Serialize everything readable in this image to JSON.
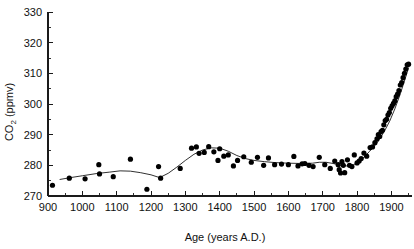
{
  "chart_data": {
    "type": "scatter",
    "title": "",
    "xlabel": "Age (years A.D.)",
    "ylabel": "CO2 (ppmv)",
    "ylabel_parts": {
      "species": "CO",
      "sub": "2",
      "unit": " (ppmv)"
    },
    "xlim": [
      900,
      1960
    ],
    "ylim": [
      270,
      330
    ],
    "x_major_ticks": [
      900,
      1000,
      1100,
      1200,
      1300,
      1400,
      1500,
      1600,
      1700,
      1800,
      1900
    ],
    "x_minor_step": 50,
    "y_major_ticks": [
      270,
      280,
      290,
      300,
      310,
      320,
      330
    ],
    "y_minor_step": 5,
    "grid": false,
    "legend": false,
    "marker": "filled-circle",
    "marker_color": "#000000",
    "line_color": "#1a1a1a",
    "series": [
      {
        "name": "CO2 measurements",
        "kind": "scatter",
        "points": [
          [
            913,
            273.5
          ],
          [
            962,
            275.8
          ],
          [
            1008,
            275.6
          ],
          [
            1048,
            280.2
          ],
          [
            1050,
            277.2
          ],
          [
            1090,
            276.3
          ],
          [
            1140,
            282.0
          ],
          [
            1188,
            272.2
          ],
          [
            1222,
            279.6
          ],
          [
            1228,
            275.8
          ],
          [
            1285,
            279.0
          ],
          [
            1318,
            285.6
          ],
          [
            1332,
            286.0
          ],
          [
            1340,
            283.9
          ],
          [
            1355,
            284.2
          ],
          [
            1368,
            286.1
          ],
          [
            1383,
            284.4
          ],
          [
            1395,
            281.6
          ],
          [
            1400,
            285.4
          ],
          [
            1412,
            283.0
          ],
          [
            1425,
            283.4
          ],
          [
            1440,
            279.8
          ],
          [
            1452,
            281.6
          ],
          [
            1470,
            282.8
          ],
          [
            1492,
            281.0
          ],
          [
            1510,
            282.6
          ],
          [
            1528,
            280.0
          ],
          [
            1542,
            282.4
          ],
          [
            1560,
            280.2
          ],
          [
            1580,
            280.4
          ],
          [
            1600,
            280.2
          ],
          [
            1616,
            282.9
          ],
          [
            1628,
            279.8
          ],
          [
            1640,
            280.5
          ],
          [
            1648,
            280.6
          ],
          [
            1660,
            280.0
          ],
          [
            1672,
            279.6
          ],
          [
            1690,
            282.6
          ],
          [
            1706,
            280.2
          ],
          [
            1722,
            279.0
          ],
          [
            1735,
            281.4
          ],
          [
            1745,
            280.2
          ],
          [
            1748,
            278.6
          ],
          [
            1752,
            277.5
          ],
          [
            1756,
            281.2
          ],
          [
            1760,
            280.0
          ],
          [
            1764,
            277.6
          ],
          [
            1772,
            281.8
          ],
          [
            1778,
            280.0
          ],
          [
            1785,
            279.6
          ],
          [
            1792,
            283.4
          ],
          [
            1800,
            280.8
          ],
          [
            1806,
            281.4
          ],
          [
            1812,
            282.2
          ],
          [
            1820,
            284.0
          ],
          [
            1828,
            283.0
          ],
          [
            1838,
            285.8
          ],
          [
            1845,
            286.0
          ],
          [
            1852,
            287.4
          ],
          [
            1858,
            288.6
          ],
          [
            1862,
            290.0
          ],
          [
            1866,
            289.4
          ],
          [
            1870,
            291.0
          ],
          [
            1874,
            291.4
          ],
          [
            1878,
            293.2
          ],
          [
            1882,
            294.6
          ],
          [
            1886,
            295.0
          ],
          [
            1890,
            296.4
          ],
          [
            1894,
            297.2
          ],
          [
            1898,
            298.6
          ],
          [
            1902,
            299.4
          ],
          [
            1906,
            300.2
          ],
          [
            1910,
            301.0
          ],
          [
            1914,
            302.4
          ],
          [
            1918,
            303.2
          ],
          [
            1922,
            304.4
          ],
          [
            1926,
            306.2
          ],
          [
            1930,
            307.0
          ],
          [
            1934,
            308.6
          ],
          [
            1938,
            310.0
          ],
          [
            1942,
            311.4
          ],
          [
            1946,
            312.8
          ],
          [
            1950,
            313.0
          ]
        ]
      },
      {
        "name": "Smoothed trend",
        "kind": "line",
        "points": [
          [
            935,
            275.4
          ],
          [
            960,
            275.9
          ],
          [
            1000,
            276.6
          ],
          [
            1040,
            277.3
          ],
          [
            1080,
            277.8
          ],
          [
            1110,
            278.2
          ],
          [
            1140,
            278.1
          ],
          [
            1170,
            277.6
          ],
          [
            1200,
            276.9
          ],
          [
            1225,
            276.0
          ],
          [
            1250,
            277.4
          ],
          [
            1275,
            279.4
          ],
          [
            1300,
            281.6
          ],
          [
            1325,
            283.6
          ],
          [
            1350,
            285.0
          ],
          [
            1375,
            285.7
          ],
          [
            1400,
            285.6
          ],
          [
            1425,
            284.6
          ],
          [
            1450,
            283.2
          ],
          [
            1475,
            282.2
          ],
          [
            1500,
            281.6
          ],
          [
            1530,
            281.2
          ],
          [
            1560,
            280.9
          ],
          [
            1600,
            280.7
          ],
          [
            1640,
            280.6
          ],
          [
            1670,
            280.7
          ],
          [
            1690,
            281.0
          ],
          [
            1710,
            281.0
          ],
          [
            1730,
            280.6
          ],
          [
            1750,
            280.1
          ],
          [
            1770,
            279.8
          ],
          [
            1790,
            280.2
          ],
          [
            1805,
            281.2
          ],
          [
            1820,
            282.6
          ],
          [
            1835,
            284.4
          ],
          [
            1850,
            286.2
          ],
          [
            1865,
            288.4
          ],
          [
            1880,
            291.2
          ],
          [
            1895,
            294.4
          ],
          [
            1910,
            298.4
          ],
          [
            1925,
            303.0
          ],
          [
            1940,
            308.2
          ],
          [
            1950,
            311.8
          ]
        ]
      }
    ]
  },
  "figure": {
    "background": "#ffffff",
    "axis_color": "#1a1a1a"
  }
}
